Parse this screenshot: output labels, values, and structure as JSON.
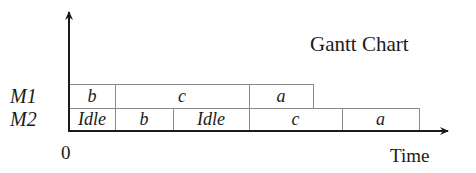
{
  "chart": {
    "title": "Gantt Chart",
    "x_axis_label": "Time",
    "origin_label": "0",
    "machines": [
      {
        "label": "M1",
        "tasks": [
          {
            "label": "b",
            "start": 0,
            "end": 46
          },
          {
            "label": "c",
            "start": 46,
            "end": 180
          },
          {
            "label": "a",
            "start": 180,
            "end": 244
          }
        ]
      },
      {
        "label": "M2",
        "tasks": [
          {
            "label": "Idle",
            "start": 0,
            "end": 46
          },
          {
            "label": "b",
            "start": 46,
            "end": 104
          },
          {
            "label": "Idle",
            "start": 104,
            "end": 180
          },
          {
            "label": "c",
            "start": 180,
            "end": 273
          },
          {
            "label": "a",
            "start": 273,
            "end": 350
          }
        ]
      }
    ],
    "colors": {
      "axis": "#1a1a1a",
      "box_border": "#8a8a8a",
      "box_fill": "#ffffff",
      "text": "#1a1a1a"
    }
  },
  "chart_data": {
    "type": "table",
    "title": "Gantt Chart",
    "xlabel": "Time",
    "ylabel": "",
    "x_origin_tick": "0",
    "categories": [
      "M1",
      "M2"
    ],
    "series": [
      {
        "name": "M1",
        "segments": [
          {
            "task": "b",
            "start": 0,
            "end": 46
          },
          {
            "task": "c",
            "start": 46,
            "end": 180
          },
          {
            "task": "a",
            "start": 180,
            "end": 244
          }
        ]
      },
      {
        "name": "M2",
        "segments": [
          {
            "task": "Idle",
            "start": 0,
            "end": 46
          },
          {
            "task": "b",
            "start": 46,
            "end": 104
          },
          {
            "task": "Idle",
            "start": 104,
            "end": 180
          },
          {
            "task": "c",
            "start": 180,
            "end": 273
          },
          {
            "task": "a",
            "start": 273,
            "end": 350
          }
        ]
      }
    ],
    "grid": false,
    "legend": "none"
  }
}
